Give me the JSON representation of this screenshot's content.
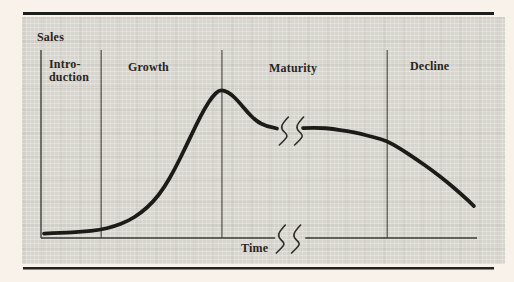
{
  "colors": {
    "background": "#f8f2ea",
    "panel": "#d7d5cd",
    "rule": "#1e1d1b",
    "curve": "#1c1b18",
    "text": "#29251f"
  },
  "figure": {
    "ylabel": "Sales",
    "xlabel": "Time",
    "phase_labels": {
      "introduction_line1": "Intro-",
      "introduction_line2": "duction",
      "growth": "Growth",
      "maturity": "Maturity",
      "decline": "Decline"
    }
  },
  "chart_data": {
    "type": "line",
    "xlabel": "Time",
    "ylabel": "Sales",
    "grid": false,
    "legend": false,
    "x_axis": {
      "range": [
        0,
        1
      ],
      "ticks": "none (conceptual axis)",
      "break_gap": [
        0.537,
        0.606
      ]
    },
    "y_axis": {
      "range": [
        0,
        1.27
      ],
      "ticks": "none (conceptual axis)"
    },
    "phases": [
      {
        "label": "Intro-duction",
        "x_start": 0.0,
        "x_end": 0.138
      },
      {
        "label": "Growth",
        "x_start": 0.138,
        "x_end": 0.415
      },
      {
        "label": "Maturity",
        "x_start": 0.415,
        "x_end": 0.794
      },
      {
        "label": "Decline",
        "x_start": 0.794,
        "x_end": 1.0
      }
    ],
    "series": [
      {
        "name": "Sales",
        "segments": [
          [
            [
              0.007,
              0.03
            ],
            [
              0.048,
              0.034
            ],
            [
              0.094,
              0.041
            ],
            [
              0.135,
              0.054
            ],
            [
              0.167,
              0.078
            ],
            [
              0.2,
              0.115
            ],
            [
              0.229,
              0.169
            ],
            [
              0.257,
              0.243
            ],
            [
              0.282,
              0.338
            ],
            [
              0.307,
              0.466
            ],
            [
              0.333,
              0.622
            ],
            [
              0.356,
              0.764
            ],
            [
              0.376,
              0.878
            ],
            [
              0.394,
              0.959
            ],
            [
              0.408,
              0.997
            ],
            [
              0.42,
              0.997
            ],
            [
              0.436,
              0.973
            ],
            [
              0.454,
              0.919
            ],
            [
              0.475,
              0.845
            ],
            [
              0.495,
              0.787
            ],
            [
              0.516,
              0.757
            ],
            [
              0.541,
              0.74
            ]
          ],
          [
            [
              0.601,
              0.743
            ],
            [
              0.635,
              0.747
            ],
            [
              0.67,
              0.736
            ],
            [
              0.702,
              0.723
            ],
            [
              0.734,
              0.703
            ],
            [
              0.766,
              0.679
            ],
            [
              0.794,
              0.655
            ],
            [
              0.826,
              0.601
            ],
            [
              0.862,
              0.53
            ],
            [
              0.899,
              0.453
            ],
            [
              0.933,
              0.375
            ],
            [
              0.966,
              0.291
            ],
            [
              0.993,
              0.216
            ]
          ]
        ]
      }
    ],
    "break_marks": {
      "curve": [
        [
          0.557,
          0.723
        ],
        [
          0.592,
          0.723
        ]
      ],
      "axis": [
        [
          0.55,
          -0.007
        ],
        [
          0.585,
          -0.007
        ]
      ]
    }
  }
}
